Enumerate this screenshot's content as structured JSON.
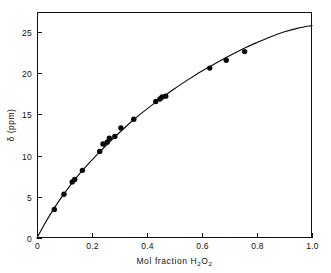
{
  "chart_data": {
    "type": "scatter",
    "title": "",
    "xlabel": "Mol fraction H2O2",
    "xlabel_parts": {
      "prefix": "Mol  fraction  H",
      "sub1": "2",
      "mid": "O",
      "sub2": "2"
    },
    "ylabel": "δ (ppm)",
    "xlim": [
      0,
      1.0
    ],
    "ylim": [
      0,
      27.4
    ],
    "xticks": [
      0,
      0.2,
      0.4,
      0.6,
      0.8,
      1.0
    ],
    "xtick_labels": [
      "0",
      "0.2",
      "0.4",
      "0.6",
      "0.8",
      "1.0"
    ],
    "yticks": [
      0,
      5,
      10,
      15,
      20,
      25
    ],
    "ytick_labels": [
      "0",
      "5",
      "10",
      "15",
      "20",
      "25"
    ],
    "grid": false,
    "legend": null,
    "tick_direction": "in",
    "marker": "filled-circle",
    "marker_color": "#080808",
    "curve_color": "#0d0d0d",
    "frame_color": "#111111",
    "background_color": "#ffffff",
    "x": [
      0.063,
      0.098,
      0.128,
      0.137,
      0.165,
      0.228,
      0.24,
      0.255,
      0.263,
      0.283,
      0.305,
      0.352,
      0.432,
      0.447,
      0.455,
      0.468,
      0.628,
      0.688,
      0.755
    ],
    "y": [
      3.45,
      5.3,
      6.8,
      7.1,
      8.2,
      10.5,
      11.4,
      11.6,
      12.1,
      12.3,
      13.35,
      14.4,
      16.55,
      16.85,
      17.1,
      17.2,
      20.6,
      21.55,
      22.6
    ],
    "points": [
      {
        "x": 0.063,
        "y": 3.45
      },
      {
        "x": 0.098,
        "y": 5.3
      },
      {
        "x": 0.128,
        "y": 6.8
      },
      {
        "x": 0.137,
        "y": 7.1
      },
      {
        "x": 0.165,
        "y": 8.2
      },
      {
        "x": 0.228,
        "y": 10.5
      },
      {
        "x": 0.24,
        "y": 11.4
      },
      {
        "x": 0.255,
        "y": 11.6
      },
      {
        "x": 0.263,
        "y": 12.1
      },
      {
        "x": 0.283,
        "y": 12.3
      },
      {
        "x": 0.305,
        "y": 13.35
      },
      {
        "x": 0.352,
        "y": 14.4
      },
      {
        "x": 0.432,
        "y": 16.55
      },
      {
        "x": 0.447,
        "y": 16.85
      },
      {
        "x": 0.455,
        "y": 17.1
      },
      {
        "x": 0.468,
        "y": 17.2
      },
      {
        "x": 0.628,
        "y": 20.6
      },
      {
        "x": 0.688,
        "y": 21.55
      },
      {
        "x": 0.755,
        "y": 22.6
      }
    ],
    "fit_curve": {
      "description": "smooth concave-down curve through origin",
      "x": [
        0.0,
        0.02,
        0.05,
        0.08,
        0.11,
        0.15,
        0.19,
        0.23,
        0.27,
        0.31,
        0.35,
        0.4,
        0.45,
        0.5,
        0.55,
        0.6,
        0.65,
        0.7,
        0.75,
        0.8,
        0.85,
        0.9,
        0.95,
        1.0
      ],
      "y": [
        0.0,
        1.25,
        2.95,
        4.5,
        5.9,
        7.6,
        9.1,
        10.5,
        11.85,
        13.1,
        14.3,
        15.65,
        16.9,
        18.1,
        19.2,
        20.25,
        21.2,
        22.1,
        22.95,
        23.7,
        24.4,
        25.0,
        25.45,
        25.75
      ]
    }
  },
  "plot_geometry": {
    "left": 37,
    "right": 312,
    "top": 12,
    "bottom": 238
  }
}
